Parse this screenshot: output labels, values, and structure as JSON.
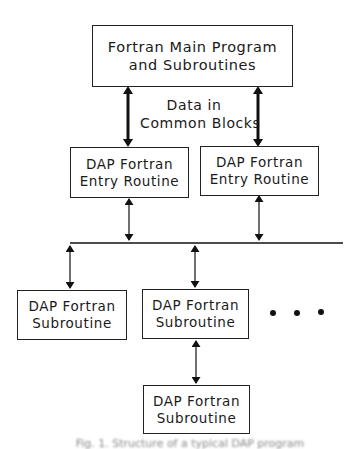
{
  "diagram": {
    "type": "block-diagram",
    "nodes": {
      "main": {
        "line1": "Fortran Main Program",
        "line2": "and Subroutines"
      },
      "entry_left": {
        "line1": "DAP Fortran",
        "line2": "Entry Routine"
      },
      "entry_right": {
        "line1": "DAP Fortran",
        "line2": "Entry Routine"
      },
      "sub_left": {
        "line1": "DAP Fortran",
        "line2": "Subroutine"
      },
      "sub_middle": {
        "line1": "DAP Fortran",
        "line2": "Subroutine"
      },
      "sub_bottom": {
        "line1": "DAP Fortran",
        "line2": "Subroutine"
      }
    },
    "edge_label": {
      "line1": "Data in",
      "line2": "Common Blocks"
    },
    "ellipsis": "• • •",
    "edges": [
      {
        "from": "main",
        "to": "entry_left",
        "style": "thick-bidirectional"
      },
      {
        "from": "main",
        "to": "entry_right",
        "style": "thick-bidirectional"
      },
      {
        "from": "entry_left",
        "to": "bus",
        "style": "thin-bidirectional"
      },
      {
        "from": "entry_right",
        "to": "bus",
        "style": "thin-bidirectional"
      },
      {
        "from": "bus",
        "to": "sub_left",
        "style": "thin-bidirectional"
      },
      {
        "from": "bus",
        "to": "sub_middle",
        "style": "thin-bidirectional"
      },
      {
        "from": "sub_middle",
        "to": "sub_bottom",
        "style": "thin-bidirectional"
      }
    ],
    "caption": "Fig. 1. Structure of a typical DAP program (partially cropped)"
  },
  "colors": {
    "line": "#1a1a1a",
    "background": "#ffffff"
  }
}
